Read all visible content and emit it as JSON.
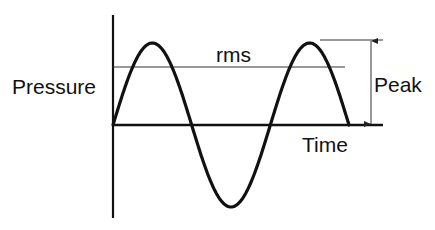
{
  "diagram": {
    "labels": {
      "y_axis": "Pressure",
      "x_axis": "Time",
      "rms": "rms",
      "peak": "Peak"
    },
    "waveform": {
      "type": "sine",
      "cycles": 1.5,
      "amplitude": 1.0,
      "rms_level": 0.707
    },
    "colors": {
      "stroke": "#111111",
      "thin_line": "#333333",
      "background": "#ffffff"
    }
  }
}
